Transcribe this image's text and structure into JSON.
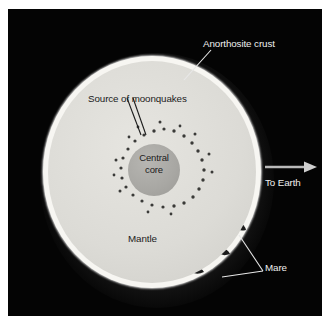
{
  "figure": {
    "background_color": "#040404",
    "frame_color": "#ffffff"
  },
  "labels": {
    "anorthosite_crust": "Anorthosite crust",
    "source_of_moonquakes": "Source of moonquakes",
    "central_core_line1": "Central",
    "central_core_line2": "core",
    "mantle": "Mantle",
    "mare": "Mare",
    "to_earth": "To Earth"
  },
  "colors": {
    "sky": "#040404",
    "crust": "#f7f6f2",
    "mantle": "#dcdbd6",
    "core": "#a8a7a3",
    "moonquake_dot": "#3a3a38",
    "light_text": "#efefef",
    "dark_text": "#1b1b1b",
    "leader_line_light": "#e8e8e8",
    "leader_line_dark": "#1b1b1b",
    "arrow": "#b9b9b9"
  },
  "diagram_data": {
    "type": "cross-section",
    "subject": "Moon",
    "layers": [
      {
        "name": "Anorthosite crust",
        "position": "outermost",
        "fill": "#f7f6f2"
      },
      {
        "name": "Mantle",
        "position": "middle",
        "fill": "#dcdbd6"
      },
      {
        "name": "Central core",
        "position": "innermost",
        "fill": "#a8a7a3"
      }
    ],
    "features": [
      {
        "name": "Source of moonquakes",
        "representation": "ring of small dots surrounding the central core"
      },
      {
        "name": "Mare",
        "representation": "dark patches on the crust edge, lower right"
      }
    ],
    "direction_indicator": {
      "label": "To Earth",
      "points": "right"
    }
  }
}
